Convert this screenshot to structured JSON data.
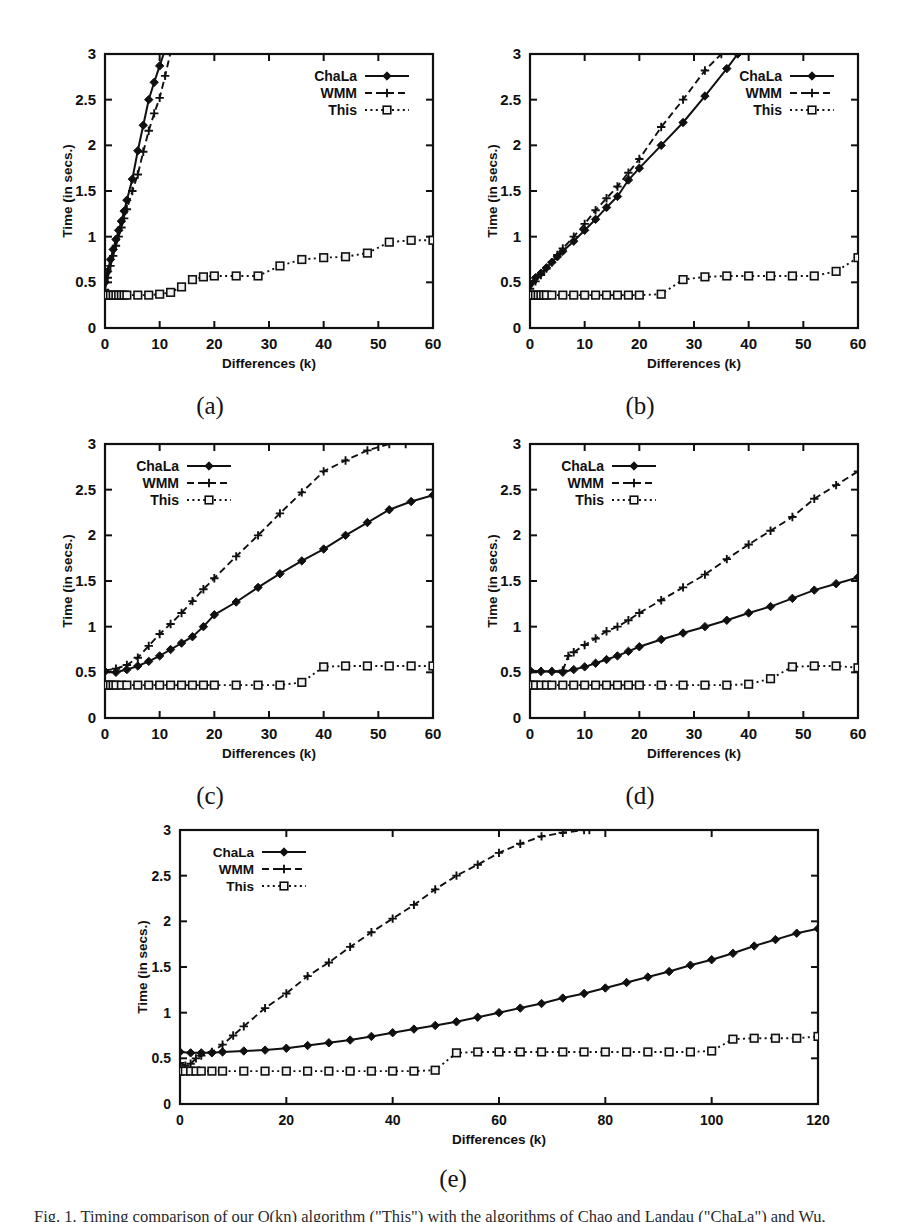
{
  "figure": {
    "caption": "Fig. 1. Timing comparison of our O(kn) algorithm (\"This\") with the algorithms of Chao and Landau (\"ChaLa\") and Wu, Manber and Myers (\"WMM\").",
    "panel_labels": [
      "(a)",
      "(b)",
      "(c)",
      "(d)",
      "(e)"
    ]
  },
  "legend": {
    "entries": [
      {
        "label": "ChaLa",
        "marker": "filled-diamond",
        "line": "solid"
      },
      {
        "label": "WMM",
        "marker": "plus",
        "line": "dashed"
      },
      {
        "label": "This",
        "marker": "open-square",
        "line": "dotted"
      }
    ]
  },
  "axes_common": {
    "xlabel": "Differences (k)",
    "ylabel": "Time (in secs.)",
    "yticks": [
      "0",
      "0.5",
      "1",
      "1.5",
      "2",
      "2.5",
      "3"
    ],
    "ylim": [
      0,
      3
    ],
    "xticks_60": [
      "0",
      "10",
      "20",
      "30",
      "40",
      "50",
      "60"
    ],
    "xlim_60": [
      0,
      60
    ],
    "xticks_120": [
      "0",
      "20",
      "40",
      "60",
      "80",
      "100",
      "120"
    ],
    "xlim_120": [
      0,
      120
    ]
  },
  "chart_data": [
    {
      "id": "a",
      "type": "line",
      "title": "(a)",
      "xlabel": "Differences (k)",
      "ylabel": "Time (in secs.)",
      "xlim": [
        0,
        60
      ],
      "ylim": [
        0,
        3
      ],
      "grid": false,
      "legend_position": "top-right",
      "series": [
        {
          "name": "ChaLa",
          "x": [
            0,
            0.5,
            1,
            1.5,
            2,
            2.5,
            3,
            3.5,
            4,
            5,
            6,
            7,
            8,
            9,
            10,
            11
          ],
          "y": [
            0.5,
            0.62,
            0.75,
            0.86,
            0.97,
            1.07,
            1.17,
            1.28,
            1.4,
            1.63,
            1.94,
            2.22,
            2.5,
            2.69,
            2.87,
            3.05
          ]
        },
        {
          "name": "WMM",
          "x": [
            0,
            0.5,
            1,
            1.5,
            2,
            2.5,
            3,
            3.5,
            4,
            5,
            6,
            7,
            8,
            9,
            10,
            11,
            12
          ],
          "y": [
            0.42,
            0.55,
            0.68,
            0.79,
            0.9,
            1.0,
            1.1,
            1.2,
            1.3,
            1.5,
            1.68,
            1.93,
            2.16,
            2.35,
            2.52,
            2.76,
            3.02
          ]
        },
        {
          "name": "This",
          "x": [
            0,
            0.5,
            1,
            1.5,
            2,
            2.5,
            3,
            3.5,
            4,
            6,
            8,
            10,
            12,
            14,
            16,
            18,
            20,
            24,
            28,
            32,
            36,
            40,
            44,
            48,
            52,
            56,
            60
          ],
          "y": [
            0.36,
            0.36,
            0.36,
            0.36,
            0.36,
            0.36,
            0.36,
            0.36,
            0.36,
            0.36,
            0.36,
            0.37,
            0.39,
            0.45,
            0.53,
            0.56,
            0.57,
            0.57,
            0.57,
            0.68,
            0.75,
            0.77,
            0.78,
            0.82,
            0.94,
            0.96,
            0.96
          ]
        }
      ]
    },
    {
      "id": "b",
      "type": "line",
      "title": "(b)",
      "xlabel": "Differences (k)",
      "ylabel": "Time (in secs.)",
      "xlim": [
        0,
        60
      ],
      "ylim": [
        0,
        3
      ],
      "grid": false,
      "legend_position": "top-right",
      "series": [
        {
          "name": "ChaLa",
          "x": [
            0,
            1,
            2,
            3,
            4,
            5,
            6,
            8,
            10,
            12,
            14,
            16,
            18,
            20,
            24,
            28,
            32,
            36,
            38
          ],
          "y": [
            0.49,
            0.55,
            0.6,
            0.66,
            0.72,
            0.78,
            0.84,
            0.95,
            1.07,
            1.19,
            1.32,
            1.44,
            1.62,
            1.75,
            2.0,
            2.25,
            2.54,
            2.84,
            3.0
          ]
        },
        {
          "name": "WMM",
          "x": [
            0,
            1,
            2,
            3,
            4,
            5,
            6,
            8,
            10,
            12,
            14,
            16,
            18,
            20,
            24,
            28,
            32,
            35
          ],
          "y": [
            0.43,
            0.51,
            0.58,
            0.65,
            0.72,
            0.8,
            0.87,
            1.0,
            1.14,
            1.29,
            1.42,
            1.55,
            1.7,
            1.85,
            2.2,
            2.5,
            2.82,
            3.0
          ]
        },
        {
          "name": "This",
          "x": [
            0,
            0.5,
            1,
            1.5,
            2,
            2.5,
            3,
            4,
            6,
            8,
            10,
            12,
            14,
            16,
            18,
            20,
            24,
            28,
            32,
            36,
            40,
            44,
            48,
            52,
            56,
            60
          ],
          "y": [
            0.36,
            0.36,
            0.36,
            0.36,
            0.36,
            0.36,
            0.36,
            0.36,
            0.36,
            0.36,
            0.36,
            0.36,
            0.36,
            0.36,
            0.36,
            0.36,
            0.37,
            0.53,
            0.56,
            0.57,
            0.57,
            0.57,
            0.57,
            0.57,
            0.62,
            0.77
          ]
        }
      ]
    },
    {
      "id": "c",
      "type": "line",
      "title": "(c)",
      "xlabel": "Differences (k)",
      "ylabel": "Time (in secs.)",
      "xlim": [
        0,
        60
      ],
      "ylim": [
        0,
        3
      ],
      "grid": false,
      "legend_position": "top-left",
      "series": [
        {
          "name": "ChaLa",
          "x": [
            0,
            2,
            4,
            6,
            8,
            10,
            12,
            14,
            16,
            18,
            20,
            24,
            28,
            32,
            36,
            40,
            44,
            48,
            52,
            56,
            60
          ],
          "y": [
            0.51,
            0.5,
            0.53,
            0.57,
            0.62,
            0.68,
            0.75,
            0.82,
            0.89,
            1.0,
            1.13,
            1.27,
            1.43,
            1.58,
            1.72,
            1.85,
            2.0,
            2.14,
            2.28,
            2.37,
            2.44
          ]
        },
        {
          "name": "WMM",
          "x": [
            0,
            2,
            4,
            6,
            8,
            10,
            12,
            14,
            16,
            18,
            20,
            24,
            28,
            32,
            36,
            40,
            44,
            48,
            52,
            55
          ],
          "y": [
            0.52,
            0.54,
            0.58,
            0.66,
            0.79,
            0.92,
            1.03,
            1.15,
            1.28,
            1.41,
            1.53,
            1.77,
            2.0,
            2.24,
            2.47,
            2.7,
            2.82,
            2.93,
            3.0,
            3.0
          ]
        },
        {
          "name": "This",
          "x": [
            0,
            0.5,
            1,
            1.5,
            2,
            3,
            4,
            6,
            8,
            10,
            12,
            14,
            16,
            18,
            20,
            24,
            28,
            32,
            36,
            40,
            44,
            48,
            52,
            56,
            60
          ],
          "y": [
            0.36,
            0.36,
            0.36,
            0.36,
            0.36,
            0.36,
            0.36,
            0.36,
            0.36,
            0.36,
            0.36,
            0.36,
            0.36,
            0.36,
            0.36,
            0.36,
            0.36,
            0.36,
            0.39,
            0.56,
            0.57,
            0.57,
            0.57,
            0.57,
            0.57
          ]
        }
      ]
    },
    {
      "id": "d",
      "type": "line",
      "title": "(d)",
      "xlabel": "Differences (k)",
      "ylabel": "Time (in secs.)",
      "xlim": [
        0,
        60
      ],
      "ylim": [
        0,
        3
      ],
      "grid": false,
      "legend_position": "top-left",
      "series": [
        {
          "name": "ChaLa",
          "x": [
            0,
            2,
            4,
            6,
            8,
            10,
            12,
            14,
            16,
            18,
            20,
            24,
            28,
            32,
            36,
            40,
            44,
            48,
            52,
            56,
            60
          ],
          "y": [
            0.52,
            0.51,
            0.51,
            0.5,
            0.53,
            0.56,
            0.6,
            0.64,
            0.68,
            0.73,
            0.78,
            0.86,
            0.93,
            1.0,
            1.07,
            1.15,
            1.22,
            1.31,
            1.4,
            1.47,
            1.54
          ]
        },
        {
          "name": "WMM",
          "x": [
            0,
            2,
            4,
            6,
            7,
            8,
            10,
            12,
            14,
            16,
            18,
            20,
            24,
            28,
            32,
            36,
            40,
            44,
            48,
            52,
            56,
            60
          ],
          "y": [
            0.52,
            0.51,
            0.51,
            0.52,
            0.68,
            0.72,
            0.8,
            0.87,
            0.95,
            1.0,
            1.07,
            1.15,
            1.29,
            1.43,
            1.57,
            1.74,
            1.9,
            2.05,
            2.2,
            2.4,
            2.55,
            2.7
          ]
        },
        {
          "name": "This",
          "x": [
            0,
            0.5,
            1,
            2,
            3,
            4,
            6,
            8,
            10,
            12,
            14,
            16,
            18,
            20,
            24,
            28,
            32,
            36,
            40,
            44,
            48,
            52,
            56,
            60
          ],
          "y": [
            0.36,
            0.36,
            0.36,
            0.36,
            0.36,
            0.36,
            0.36,
            0.36,
            0.36,
            0.36,
            0.36,
            0.36,
            0.36,
            0.36,
            0.36,
            0.36,
            0.36,
            0.36,
            0.37,
            0.43,
            0.56,
            0.57,
            0.57,
            0.55
          ]
        }
      ]
    },
    {
      "id": "e",
      "type": "line",
      "title": "(e)",
      "xlabel": "Differences (k)",
      "ylabel": "Time (in secs.)",
      "xlim": [
        0,
        120
      ],
      "ylim": [
        0,
        3
      ],
      "grid": false,
      "legend_position": "top-left",
      "series": [
        {
          "name": "ChaLa",
          "x": [
            0,
            2,
            4,
            6,
            8,
            12,
            16,
            20,
            24,
            28,
            32,
            36,
            40,
            44,
            48,
            52,
            56,
            60,
            64,
            68,
            72,
            76,
            80,
            84,
            88,
            92,
            96,
            100,
            104,
            108,
            112,
            116,
            120
          ],
          "y": [
            0.57,
            0.56,
            0.56,
            0.56,
            0.57,
            0.58,
            0.59,
            0.61,
            0.64,
            0.67,
            0.7,
            0.74,
            0.78,
            0.82,
            0.86,
            0.9,
            0.95,
            1.0,
            1.05,
            1.1,
            1.16,
            1.21,
            1.27,
            1.33,
            1.39,
            1.45,
            1.52,
            1.58,
            1.65,
            1.73,
            1.8,
            1.87,
            1.92
          ]
        },
        {
          "name": "WMM",
          "x": [
            0,
            1,
            2,
            3,
            4,
            6,
            8,
            10,
            12,
            16,
            20,
            24,
            28,
            32,
            36,
            40,
            44,
            48,
            52,
            56,
            60,
            64,
            68,
            72,
            76,
            77
          ],
          "y": [
            0.45,
            0.42,
            0.44,
            0.5,
            0.53,
            0.57,
            0.65,
            0.75,
            0.85,
            1.05,
            1.21,
            1.4,
            1.55,
            1.72,
            1.88,
            2.03,
            2.18,
            2.35,
            2.5,
            2.62,
            2.75,
            2.85,
            2.93,
            2.97,
            3.0,
            3.0
          ]
        },
        {
          "name": "This",
          "x": [
            0,
            1,
            2,
            3,
            4,
            6,
            8,
            12,
            16,
            20,
            24,
            28,
            32,
            36,
            40,
            44,
            48,
            52,
            56,
            60,
            64,
            68,
            72,
            76,
            80,
            84,
            88,
            92,
            96,
            100,
            104,
            108,
            112,
            116,
            120
          ],
          "y": [
            0.36,
            0.36,
            0.36,
            0.36,
            0.36,
            0.36,
            0.36,
            0.36,
            0.36,
            0.36,
            0.36,
            0.36,
            0.36,
            0.36,
            0.36,
            0.36,
            0.37,
            0.56,
            0.57,
            0.57,
            0.57,
            0.57,
            0.57,
            0.57,
            0.57,
            0.57,
            0.57,
            0.57,
            0.57,
            0.58,
            0.71,
            0.72,
            0.72,
            0.72,
            0.74
          ]
        }
      ]
    }
  ]
}
